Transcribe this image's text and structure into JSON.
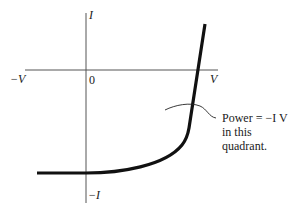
{
  "diagram": {
    "title": "",
    "axes": {
      "y_pos_label": "I",
      "y_neg_label": "−I",
      "x_neg_label": "−V",
      "x_pos_label": "V",
      "origin_label": "0"
    },
    "annotation": {
      "line1": "Power = −I V",
      "line2": "in this",
      "line3": "quadrant."
    },
    "colors": {
      "axis": "#555555",
      "curve": "#111111",
      "text": "#1a1a1a"
    }
  }
}
